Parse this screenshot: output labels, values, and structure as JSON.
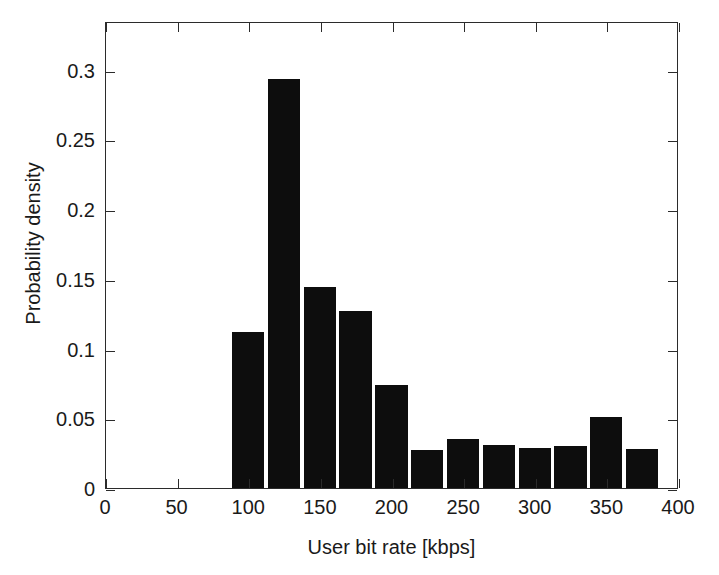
{
  "chart_data": {
    "type": "bar",
    "title": "",
    "subtitle": "",
    "xlabel": "User bit rate [kbps]",
    "ylabel": "Probability density",
    "xlim": [
      0,
      400
    ],
    "ylim": [
      0,
      0.3349
    ],
    "grid": false,
    "legend": null,
    "bar_color": "#0d0d0d",
    "frame_color": "#2b2b2b",
    "background": "#ffffff",
    "bin_width": 25,
    "xticks": [
      0,
      50,
      100,
      150,
      200,
      250,
      300,
      350,
      400
    ],
    "xtick_labels": [
      "0",
      "50",
      "100",
      "150",
      "200",
      "250",
      "300",
      "350",
      "400"
    ],
    "yticks": [
      0,
      0.05,
      0.1,
      0.15,
      0.2,
      0.25,
      0.3
    ],
    "ytick_labels": [
      "0",
      "0.05",
      "0.1",
      "0.15",
      "0.2",
      "0.25",
      "0.3"
    ],
    "bins": [
      {
        "x0": 88,
        "x1": 113,
        "center": 100.5,
        "value": 0.112
      },
      {
        "x0": 113,
        "x1": 138,
        "center": 125.5,
        "value": 0.293
      },
      {
        "x0": 138,
        "x1": 163,
        "center": 150.5,
        "value": 0.144
      },
      {
        "x0": 163,
        "x1": 188,
        "center": 175.5,
        "value": 0.127
      },
      {
        "x0": 188,
        "x1": 213,
        "center": 200.5,
        "value": 0.074
      },
      {
        "x0": 213,
        "x1": 238,
        "center": 225.5,
        "value": 0.027
      },
      {
        "x0": 238,
        "x1": 263,
        "center": 250.5,
        "value": 0.035
      },
      {
        "x0": 263,
        "x1": 288,
        "center": 275.5,
        "value": 0.031
      },
      {
        "x0": 288,
        "x1": 313,
        "center": 300.5,
        "value": 0.029
      },
      {
        "x0": 313,
        "x1": 338,
        "center": 325.5,
        "value": 0.03
      },
      {
        "x0": 338,
        "x1": 363,
        "center": 350.5,
        "value": 0.051
      },
      {
        "x0": 363,
        "x1": 388,
        "center": 375.5,
        "value": 0.028
      }
    ],
    "categories": [
      "88-113",
      "113-138",
      "138-163",
      "163-188",
      "188-213",
      "213-238",
      "238-263",
      "263-288",
      "288-313",
      "313-338",
      "338-363",
      "363-388"
    ],
    "values": [
      0.112,
      0.293,
      0.144,
      0.127,
      0.074,
      0.027,
      0.035,
      0.031,
      0.029,
      0.03,
      0.051,
      0.028
    ]
  }
}
